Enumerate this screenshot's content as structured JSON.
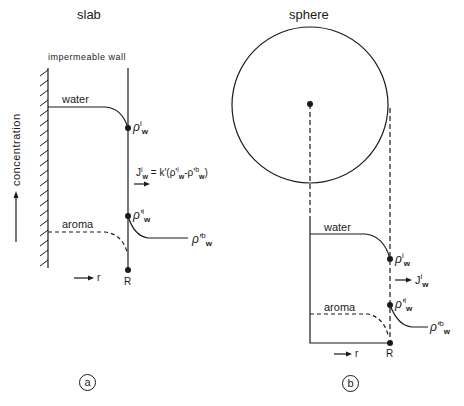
{
  "panel_a": {
    "title": "slab",
    "wall_label": "impermeable wall",
    "water_label": "water",
    "aroma_label": "aroma",
    "rho_i_w": {
      "base": "ρ",
      "sup": "i",
      "sub": "w"
    },
    "rho_prime_i_w": {
      "base": "ρ'",
      "sup": "i",
      "sub": "w"
    },
    "rho_prime_b_w": {
      "base": "ρ'",
      "sup": "b",
      "sub": "w"
    },
    "flux_equation": "Jⁱw = k'(ρ'ⁱw - ρ'ᵇw)",
    "flux_parts": {
      "J": "J",
      "J_sup": "i",
      "J_sub": "w",
      "eq": " = k'(ρ'",
      "p1_sup": "i",
      "p1_sub": "w",
      "minus": "-ρ'",
      "p2_sup": "b",
      "p2_sub": "w",
      "close": ")"
    },
    "radius_label": "R",
    "r_axis_label": "r",
    "y_axis_label": "concentration",
    "panel_label": "a"
  },
  "panel_b": {
    "title": "sphere",
    "water_label": "water",
    "aroma_label": "aroma",
    "rho_i_w": {
      "base": "ρ",
      "sup": "i",
      "sub": "w"
    },
    "rho_prime_i_w": {
      "base": "ρ'",
      "sup": "i",
      "sub": "w"
    },
    "rho_prime_b_w": {
      "base": "ρ'",
      "sup": "b",
      "sub": "w"
    },
    "flux": {
      "base": "J",
      "sup": "i",
      "sub": "w"
    },
    "radius_label": "R",
    "r_axis_label": "r",
    "panel_label": "b"
  },
  "colors": {
    "ink": "#1a1a1a",
    "background": "#ffffff"
  }
}
